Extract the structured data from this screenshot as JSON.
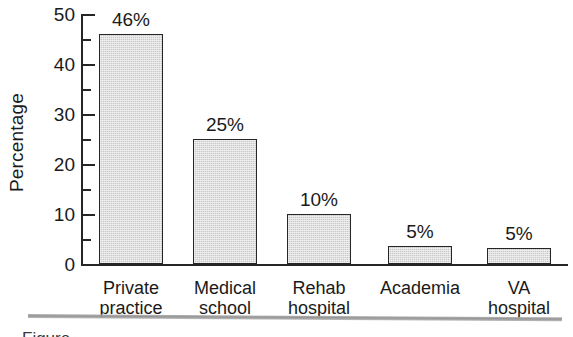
{
  "chart_data": {
    "type": "bar",
    "title": "",
    "subtitle": "",
    "xlabel": "",
    "ylabel": "Percentage",
    "categories": [
      "Private\npractice",
      "Medical\nschool",
      "Rehab\nhospital",
      "Academia",
      "VA\nhospital"
    ],
    "values": [
      46,
      25,
      10,
      5,
      5
    ],
    "data_labels": [
      "46%",
      "25%",
      "10%",
      "5%",
      "5%"
    ],
    "ylim": [
      0,
      50
    ],
    "ytick_labels": [
      "50",
      "40",
      "30",
      "20",
      "10",
      "0"
    ],
    "ytick_values": [
      50,
      40,
      30,
      20,
      10,
      0
    ],
    "yminor_tick_values": [
      45,
      35,
      25,
      15,
      5
    ],
    "grid": false,
    "legend": false,
    "legend_position": "none",
    "bar_fill_color": "#c9c9c9",
    "bar_edge_color": "#262626",
    "axis_color": "#262626",
    "background_color": "#ffffff"
  },
  "figure": {
    "caption_rule_visible": true,
    "caption_partial_text": "Figure"
  }
}
